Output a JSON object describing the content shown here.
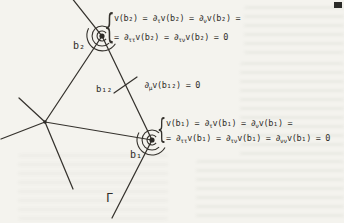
{
  "figure": {
    "ink_color": "#35322d",
    "paper_color": "#f4f3ee",
    "boundary_label": "Γ",
    "vertex_b2": {
      "label": "b₂",
      "eq_line1": "v(b₂) = ∂[τ]v(b₂) = ∂[ν]v(b₂) =",
      "eq_line2": "= ∂[ττ]v(b₂) = ∂[τν]v(b₂) = 0",
      "brace": "{"
    },
    "vertex_b1": {
      "label": "b₁",
      "eq_line1": "v(b₁) = ∂[τ]v(b₁) = ∂[ν]v(b₁) =",
      "eq_line2": "= ∂[ττ]v(b₁) = ∂[τν]v(b₁) = ∂[νν]v(b₁) = 0",
      "brace": "{"
    },
    "edge_midpoint": {
      "label": "b₁₂",
      "equation": "∂[μ]v(b₁₂) = 0"
    }
  }
}
